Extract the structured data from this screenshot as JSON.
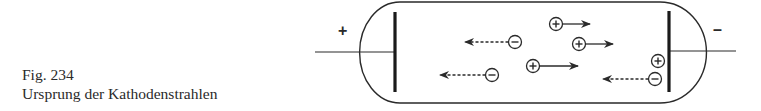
{
  "caption": {
    "figure_number": "Fig. 234",
    "title": "Ursprung der Kathodenstrahlen"
  },
  "diagram": {
    "anode_sign": "+",
    "cathode_sign": "–",
    "ion_symbols": {
      "positive": "+",
      "negative": "−"
    },
    "particles": [
      {
        "charge": "negative",
        "direction": "left",
        "arrow_style": "dashed",
        "location": "tube-middle"
      },
      {
        "charge": "negative",
        "direction": "left",
        "arrow_style": "dashed",
        "location": "tube-lower"
      },
      {
        "charge": "positive",
        "direction": "right",
        "arrow_style": "solid",
        "location": "tube-top"
      },
      {
        "charge": "positive",
        "direction": "right",
        "arrow_style": "solid",
        "location": "tube-upper-middle"
      },
      {
        "charge": "positive",
        "direction": "right",
        "arrow_style": "solid",
        "location": "tube-lower-middle"
      },
      {
        "charge": "positive",
        "direction": "none",
        "arrow_style": "none",
        "location": "at-cathode"
      },
      {
        "charge": "negative",
        "direction": "left",
        "arrow_style": "dashed",
        "location": "leaving-cathode"
      }
    ],
    "colors": {
      "ink": "#2a2a2a",
      "background": "#ffffff"
    }
  }
}
